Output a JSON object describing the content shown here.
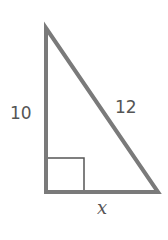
{
  "diagram": {
    "type": "right-triangle",
    "labels": {
      "vertical_leg": "10",
      "hypotenuse": "12",
      "horizontal_leg": "x"
    },
    "colors": {
      "stroke": "#7a7a7a",
      "right_angle_marker": "#555555",
      "text": "#555555"
    }
  }
}
